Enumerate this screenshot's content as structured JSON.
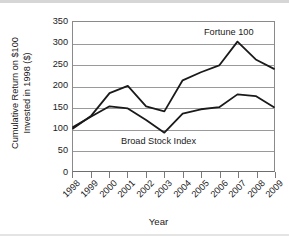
{
  "chart_data": {
    "type": "line",
    "title": "",
    "xlabel": "Year",
    "ylabel": "Cumulative Return on $100 Invested in 1998 ($)",
    "ylabel_line1": "Cumulative Return on $100",
    "ylabel_line2": "Invested in 1998 ($)",
    "categories": [
      "1998",
      "1999",
      "2000",
      "2001",
      "2002",
      "2003",
      "2004",
      "2005",
      "2006",
      "2007",
      "2008",
      "2009"
    ],
    "x": [
      1998,
      1999,
      2000,
      2001,
      2002,
      2003,
      2004,
      2005,
      2006,
      2007,
      2008,
      2009
    ],
    "ylim": [
      0,
      350
    ],
    "yticks": [
      0,
      50,
      100,
      150,
      200,
      250,
      300,
      350
    ],
    "grid": true,
    "legend_position": "inline-annotation",
    "series": [
      {
        "name": "Fortune 100",
        "color": "#1a1a1a",
        "values": [
          100,
          130,
          183,
          200,
          152,
          140,
          213,
          232,
          248,
          304,
          262,
          240
        ]
      },
      {
        "name": "Broad Stock Index",
        "color": "#1a1a1a",
        "values": [
          103,
          128,
          152,
          147,
          120,
          90,
          135,
          145,
          150,
          180,
          176,
          150
        ]
      }
    ],
    "annotations": [
      {
        "text": "Fortune 100",
        "series": "Fortune 100"
      },
      {
        "text": "Broad Stock Index",
        "series": "Broad Stock Index"
      }
    ]
  },
  "colors": {
    "line": "#1a1a1a",
    "grid": "#9a9a9a",
    "axis": "#6e6e6e",
    "text": "#1a1a1a",
    "background": "#ffffff"
  }
}
